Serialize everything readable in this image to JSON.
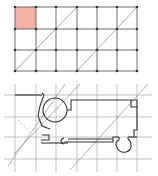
{
  "colors": {
    "grid": "#4a4a4a",
    "light_grid": "#9a9a9a",
    "highlight": "#f4b1a6",
    "ink": "#333333",
    "background": "#ffffff"
  },
  "top_grid": {
    "columns_x": [
      15,
      36,
      56,
      77,
      97,
      117,
      137
    ],
    "rows_y": [
      7,
      29,
      50,
      71
    ],
    "highlighted_cell": {
      "col": 0,
      "row": 0
    },
    "diagonals": [
      {
        "x1": 15,
        "y1": 71,
        "x2": 77,
        "y2": 7
      },
      {
        "x1": 77,
        "y1": 71,
        "x2": 137,
        "y2": 7
      }
    ]
  },
  "bottom_plan": {
    "grid_columns_x": [
      15,
      36,
      56,
      77,
      97,
      117,
      137
    ],
    "grid_rows_y": [
      13,
      35,
      55,
      77
    ],
    "diagonals": [
      {
        "x1": 5,
        "y1": 88,
        "x2": 62,
        "y2": 4
      },
      {
        "x1": 72,
        "y1": 88,
        "x2": 145,
        "y2": 4
      },
      {
        "x1": 12,
        "y1": 80,
        "x2": 84,
        "y2": 2
      }
    ],
    "circle": {
      "cx": 55,
      "cy": 28,
      "r": 12
    }
  }
}
